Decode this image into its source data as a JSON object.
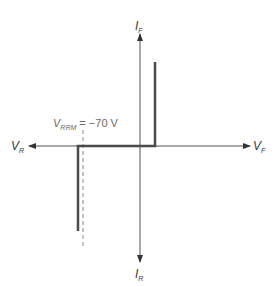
{
  "diagram": {
    "type": "diode-iv-characteristic",
    "axes": {
      "x_positive": {
        "symbol": "V",
        "subscript": "F"
      },
      "x_negative": {
        "symbol": "V",
        "subscript": "R"
      },
      "y_positive": {
        "symbol": "I",
        "subscript": "F"
      },
      "y_negative": {
        "symbol": "I",
        "subscript": "R"
      }
    },
    "annotation": {
      "symbol": "V",
      "subscript": "RRM",
      "equals": " = ",
      "value": "−70 V"
    },
    "colors": {
      "axis": "#555555",
      "curve": "#4a4a4a",
      "dashed": "#888888",
      "label": "#3a3a3a"
    }
  }
}
